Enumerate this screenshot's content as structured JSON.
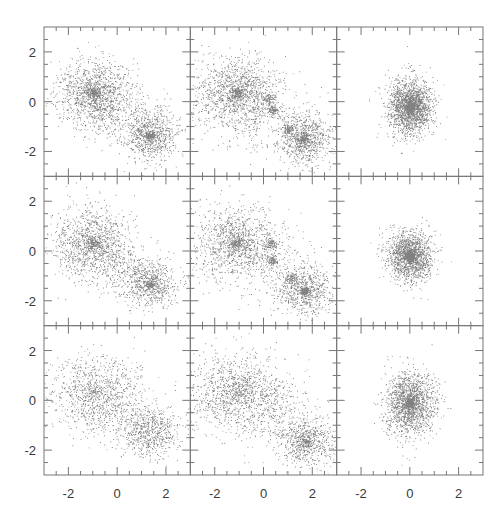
{
  "chart_data": {
    "type": "scatter",
    "layout": {
      "rows": 3,
      "cols": 3,
      "shared_axes": true
    },
    "title": "",
    "xlabel": "",
    "ylabel": "",
    "xlim": [
      -3,
      3
    ],
    "ylim": [
      -3,
      3
    ],
    "major_ticks": [
      -2,
      0,
      2
    ],
    "minor_tick_step": 0.5,
    "tick_labels": [
      "-2",
      "0",
      "2"
    ],
    "grid": false,
    "legend": null,
    "point_color": "#1a1a1a",
    "panels": [
      {
        "row": 0,
        "col": 0,
        "n_points": 2600,
        "description": "two clumps, diffuse",
        "clusters": [
          {
            "cx": -0.95,
            "cy": 0.35,
            "sx": 0.75,
            "sy": 0.65,
            "weight": 0.55,
            "core": 0.12
          },
          {
            "cx": 1.35,
            "cy": -1.35,
            "sx": 0.55,
            "sy": 0.5,
            "weight": 0.35,
            "core": 0.15
          },
          {
            "cx": 0.2,
            "cy": -0.5,
            "sx": 0.9,
            "sy": 0.6,
            "weight": 0.1,
            "core": 0.0
          }
        ]
      },
      {
        "row": 0,
        "col": 1,
        "n_points": 2900,
        "description": "two clumps with substructure",
        "clusters": [
          {
            "cx": -1.1,
            "cy": 0.35,
            "sx": 0.85,
            "sy": 0.75,
            "weight": 0.5,
            "core": 0.12
          },
          {
            "cx": 0.35,
            "cy": -0.35,
            "sx": 0.12,
            "sy": 0.1,
            "weight": 0.04,
            "core": 0.0
          },
          {
            "cx": 0.2,
            "cy": 0.1,
            "sx": 0.15,
            "sy": 0.12,
            "weight": 0.03,
            "core": 0.0
          },
          {
            "cx": 1.65,
            "cy": -1.5,
            "sx": 0.55,
            "sy": 0.5,
            "weight": 0.33,
            "core": 0.15
          },
          {
            "cx": 1.0,
            "cy": -1.1,
            "sx": 0.12,
            "sy": 0.12,
            "weight": 0.03,
            "core": 0.0
          },
          {
            "cx": 0.3,
            "cy": -0.6,
            "sx": 1.0,
            "sy": 0.7,
            "weight": 0.07,
            "core": 0.0
          }
        ]
      },
      {
        "row": 0,
        "col": 2,
        "n_points": 2600,
        "description": "single merged clump",
        "clusters": [
          {
            "cx": 0.0,
            "cy": -0.2,
            "sx": 0.45,
            "sy": 0.55,
            "weight": 1.0,
            "core": 0.25
          }
        ]
      },
      {
        "row": 1,
        "col": 0,
        "n_points": 2300,
        "description": "two clumps, diffuse",
        "clusters": [
          {
            "cx": -1.0,
            "cy": 0.3,
            "sx": 0.8,
            "sy": 0.7,
            "weight": 0.58,
            "core": 0.1
          },
          {
            "cx": 1.35,
            "cy": -1.35,
            "sx": 0.55,
            "sy": 0.45,
            "weight": 0.32,
            "core": 0.12
          },
          {
            "cx": 0.4,
            "cy": -0.7,
            "sx": 0.7,
            "sy": 0.5,
            "weight": 0.1,
            "core": 0.0
          }
        ]
      },
      {
        "row": 1,
        "col": 1,
        "n_points": 2600,
        "description": "two clumps with substructure",
        "clusters": [
          {
            "cx": -1.1,
            "cy": 0.35,
            "sx": 0.85,
            "sy": 0.75,
            "weight": 0.52,
            "core": 0.1
          },
          {
            "cx": 0.3,
            "cy": 0.3,
            "sx": 0.12,
            "sy": 0.12,
            "weight": 0.03,
            "core": 0.0
          },
          {
            "cx": 0.35,
            "cy": -0.35,
            "sx": 0.1,
            "sy": 0.1,
            "weight": 0.03,
            "core": 0.0
          },
          {
            "cx": 1.7,
            "cy": -1.6,
            "sx": 0.55,
            "sy": 0.5,
            "weight": 0.32,
            "core": 0.15
          },
          {
            "cx": 1.1,
            "cy": -1.1,
            "sx": 0.12,
            "sy": 0.12,
            "weight": 0.03,
            "core": 0.0
          },
          {
            "cx": 0.3,
            "cy": -0.6,
            "sx": 1.0,
            "sy": 0.7,
            "weight": 0.07,
            "core": 0.0
          }
        ]
      },
      {
        "row": 1,
        "col": 2,
        "n_points": 2200,
        "description": "single merged clump",
        "clusters": [
          {
            "cx": 0.0,
            "cy": -0.2,
            "sx": 0.45,
            "sy": 0.5,
            "weight": 1.0,
            "core": 0.25
          }
        ]
      },
      {
        "row": 2,
        "col": 0,
        "n_points": 1800,
        "description": "two clumps, very diffuse",
        "clusters": [
          {
            "cx": -0.9,
            "cy": 0.3,
            "sx": 0.9,
            "sy": 0.75,
            "weight": 0.55,
            "core": 0.04
          },
          {
            "cx": 1.35,
            "cy": -1.3,
            "sx": 0.6,
            "sy": 0.5,
            "weight": 0.35,
            "core": 0.0
          },
          {
            "cx": 0.3,
            "cy": -0.6,
            "sx": 0.9,
            "sy": 0.6,
            "weight": 0.1,
            "core": 0.0
          }
        ]
      },
      {
        "row": 2,
        "col": 1,
        "n_points": 2200,
        "description": "two clumps, diffuse",
        "clusters": [
          {
            "cx": -1.0,
            "cy": 0.35,
            "sx": 0.95,
            "sy": 0.8,
            "weight": 0.55,
            "core": 0.06
          },
          {
            "cx": 1.75,
            "cy": -1.65,
            "sx": 0.55,
            "sy": 0.5,
            "weight": 0.33,
            "core": 0.1
          },
          {
            "cx": 0.4,
            "cy": -0.5,
            "sx": 1.0,
            "sy": 0.7,
            "weight": 0.12,
            "core": 0.0
          }
        ]
      },
      {
        "row": 2,
        "col": 2,
        "n_points": 1900,
        "description": "single merged clump",
        "clusters": [
          {
            "cx": 0.0,
            "cy": -0.1,
            "sx": 0.5,
            "sy": 0.6,
            "weight": 1.0,
            "core": 0.12
          }
        ]
      }
    ]
  },
  "axes": {
    "y_tick_labels": [
      "2",
      "0",
      "-2"
    ],
    "x_tick_labels": [
      "-2",
      "0",
      "2"
    ]
  }
}
